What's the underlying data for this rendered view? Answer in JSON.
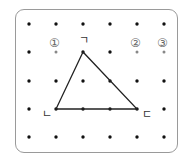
{
  "grid": {
    "columns_x": [
      29,
      56,
      83,
      110,
      137,
      164
    ],
    "rows_y": [
      24,
      52,
      81,
      109,
      137
    ],
    "dot_color": "#111111",
    "candidate_dot_color": "#888888"
  },
  "triangle": {
    "vertices": [
      {
        "name": "ㄱ",
        "col": 3,
        "row": 2
      },
      {
        "name": "ㄴ",
        "col": 2,
        "row": 4
      },
      {
        "name": "ㄷ",
        "col": 5,
        "row": 4
      }
    ],
    "stroke": "#222222"
  },
  "labels": {
    "vertex_top": "ㄱ",
    "vertex_left": "ㄴ",
    "vertex_right": "ㄷ"
  },
  "options": [
    {
      "label": "①",
      "col": 2,
      "row": 2
    },
    {
      "label": "②",
      "col": 5,
      "row": 2
    },
    {
      "label": "③",
      "col": 6,
      "row": 2
    }
  ]
}
